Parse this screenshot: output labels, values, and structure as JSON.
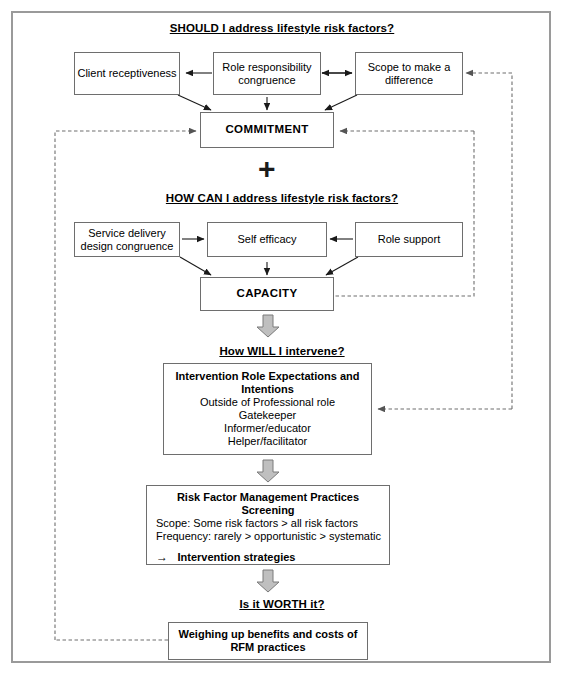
{
  "diagram": {
    "title_hidden": "Model of lifestyle risk factor management",
    "sections": {
      "should": {
        "heading": "SHOULD I address lifestyle risk factors?",
        "boxes": {
          "client_receptiveness": "Client receptiveness",
          "role_responsibility_congruence_line1": "Role responsibility",
          "role_responsibility_congruence_line2": "congruence",
          "scope_line1": "Scope to make a",
          "scope_line2": "difference",
          "commitment": "COMMITMENT"
        }
      },
      "operator": {
        "plus": "+"
      },
      "how_can": {
        "heading": "HOW CAN I address lifestyle risk factors?",
        "boxes": {
          "service_delivery_line1": "Service delivery",
          "service_delivery_line2": "design congruence",
          "self_efficacy": "Self efficacy",
          "role_support": "Role support",
          "capacity": "CAPACITY"
        }
      },
      "how_will": {
        "heading": "How WILL I intervene?",
        "box": {
          "title_line1": "Intervention Role Expectations and",
          "title_line2": "Intentions",
          "items": [
            "Outside of Professional role",
            "Gatekeeper",
            "Informer/educator",
            "Helper/facilitator"
          ]
        }
      },
      "practices": {
        "box": {
          "title_line1": "Risk Factor Management Practices",
          "title_line2": "Screening",
          "scope": "Scope: Some risk factors > all risk factors",
          "frequency": "Frequency:  rarely > opportunistic > systematic",
          "arrow_glyph": "→",
          "strategies": "Intervention strategies"
        }
      },
      "worth": {
        "heading": "Is it WORTH it?",
        "box": {
          "line1": "Weighing up benefits and costs of",
          "line2": "RFM practices"
        }
      }
    },
    "colors": {
      "frame_border": "#9a9a9a",
      "box_border": "#6e6e6e",
      "line": "#1a1a1a",
      "dashed_line": "#8a8a8a",
      "block_arrow_fill": "#bfbfbf",
      "block_arrow_stroke": "#7a7a7a",
      "text": "#000000",
      "background": "#ffffff"
    }
  }
}
